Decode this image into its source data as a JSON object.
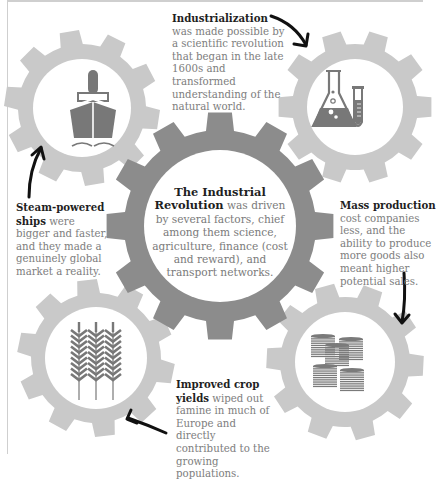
{
  "title": "The Industrial Revolution",
  "colors": {
    "central_gear": "#8c8c8c",
    "small_gear": "#c9c9c9",
    "icon": "#787878",
    "heading_text": "#1f1f1f",
    "body_text": "#7d7d7d",
    "arrow": "#111111"
  },
  "center": {
    "heading": "The Industrial Revolution",
    "heading_line1": "The Industrial",
    "heading_line2": "Revolution",
    "body": "was driven by several factors, chief among them science, agriculture, finance (cost and reward), and transport networks."
  },
  "callouts": {
    "industrialization": {
      "heading": "Industrialization",
      "body": "was made possible by a scientific revolution that began in the late 1600s and transformed understanding of the natural world.",
      "icon": "laboratory-flask-and-test-tube-icon"
    },
    "steam_ships": {
      "heading": "Steam-powered ships",
      "body": "were bigger and faster, and they made a genuinely global market a reality.",
      "icon": "steamship-icon"
    },
    "mass_production": {
      "heading": "Mass production",
      "body": "cost companies less, and the ability to produce more goods also meant higher potential sales.",
      "icon": "coin-stacks-icon"
    },
    "crop_yields": {
      "heading": "Improved crop yields",
      "body": "wiped out famine in much of Europe and directly contributed to the growing populations.",
      "icon": "wheat-icon"
    }
  }
}
